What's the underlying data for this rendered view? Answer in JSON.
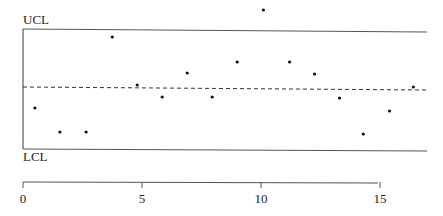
{
  "chart_data": {
    "type": "scatter",
    "title": "",
    "xlabel": "",
    "ylabel": "",
    "ucl_label": "UCL",
    "lcl_label": "LCL",
    "x": [
      0.5,
      1.55,
      2.65,
      3.75,
      4.8,
      5.85,
      6.9,
      7.95,
      9.0,
      10.1,
      11.2,
      12.25,
      13.3,
      14.3,
      15.4,
      16.4
    ],
    "y_pixels": [
      108,
      132,
      132,
      37,
      85,
      97,
      73,
      97,
      62,
      10,
      62,
      74,
      98,
      134,
      111,
      87
    ],
    "xticks": [
      0,
      5,
      10,
      15
    ],
    "xlim": [
      0,
      17
    ],
    "center_line": "dashed",
    "grid": false,
    "legend": "none"
  },
  "axis": {
    "tick_labels": [
      "0",
      "5",
      "10",
      "15"
    ]
  }
}
